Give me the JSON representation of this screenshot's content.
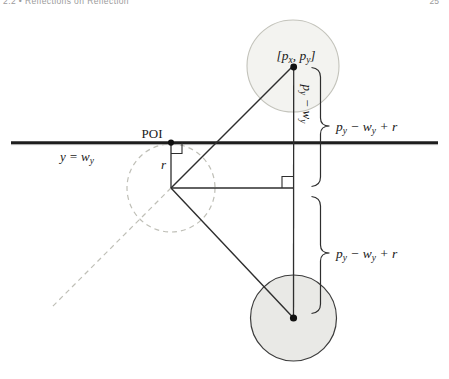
{
  "page": {
    "header_left": "2.2 • Reflections on Reflection",
    "page_number": "25"
  },
  "colors": {
    "line_dark": "#1e1e1e",
    "stroke_medium": "#2e2e2e",
    "dashed_gray": "#bfbfb7",
    "top_circle_fill": "#f3f3f0",
    "top_circle_stroke": "#c3c3bb",
    "bottom_circle_fill": "#e9e9e6",
    "bottom_circle_stroke": "#3c3c3c",
    "header_gray": "#9b9b9b"
  },
  "diagram": {
    "labels": {
      "point": {
        "p1": "[p",
        "s1": "x",
        "p2": ", p",
        "s2": "y",
        "p3": "]"
      },
      "poi": "POI",
      "line_eq": {
        "p1": "y = w",
        "s1": "y"
      },
      "radius": "r",
      "vertical": {
        "p1": "p",
        "s1": "y",
        "p2": " − w",
        "s2": "y"
      },
      "brace_top": {
        "p1": "p",
        "s1": "y",
        "p2": " − w",
        "s2": "y",
        "p3": " + r"
      },
      "brace_bottom": {
        "p1": "p",
        "s1": "y",
        "p2": " − w",
        "s2": "y",
        "p3": " + r"
      }
    }
  }
}
